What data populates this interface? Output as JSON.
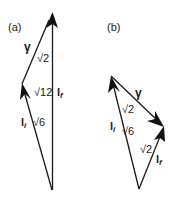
{
  "panels": [
    {
      "id": "a",
      "label": "(a)",
      "vectors": {
        "li": {
          "symbol": "l",
          "subscript": "i",
          "magnitude": "√6"
        },
        "lf": {
          "symbol": "l",
          "subscript": "f",
          "magnitude": "√12"
        },
        "gamma": {
          "symbol": "γ",
          "magnitude": "√2"
        }
      }
    },
    {
      "id": "b",
      "label": "(b)",
      "vectors": {
        "li": {
          "symbol": "l",
          "subscript": "i",
          "magnitude": "√6"
        },
        "lf": {
          "symbol": "l",
          "subscript": "f",
          "magnitude": "√2"
        },
        "gamma": {
          "symbol": "γ",
          "magnitude": "√2"
        }
      }
    }
  ],
  "colors": {
    "stroke": "#1a1a1a",
    "background": "#ffffff"
  }
}
